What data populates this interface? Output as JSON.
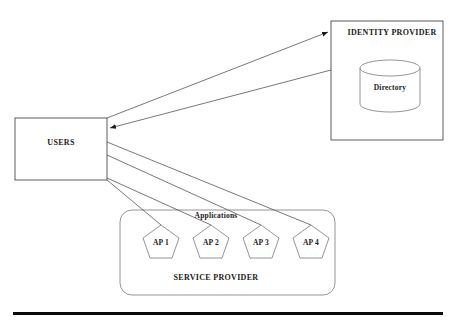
{
  "diagram": {
    "title_semantics": "federated-identity-architecture",
    "colors": {
      "stroke": "#4a4a4a",
      "line": "#555555",
      "text": "#1a1a1a",
      "background": "#ffffff",
      "rule": "#0a0a0a"
    },
    "nodes": {
      "users": {
        "label": "USERS",
        "x": 15,
        "y": 118,
        "width": 92,
        "height": 62
      },
      "identity_provider": {
        "label": "IDENTITY PROVIDER",
        "x": 331,
        "y": 21,
        "width": 112,
        "height": 119
      },
      "directory": {
        "label": "Directory",
        "cx": 390,
        "cy": 86,
        "rx": 30,
        "ry": 8,
        "height": 52
      },
      "service_provider": {
        "label": "SERVICE PROVIDER",
        "x": 120,
        "y": 210,
        "width": 215,
        "height": 85,
        "radius": 12
      },
      "applications_label": {
        "label": "Applications",
        "cx": 216,
        "cy": 215
      }
    },
    "applications": [
      {
        "label": "AP 1",
        "cx": 161,
        "cy": 241
      },
      {
        "label": "AP 2",
        "cx": 211,
        "cy": 241
      },
      {
        "label": "AP 3",
        "cx": 261,
        "cy": 241
      },
      {
        "label": "AP 4",
        "cx": 311,
        "cy": 241
      }
    ],
    "connections": [
      {
        "name": "users-to-identity-provider",
        "from": "users",
        "to": "identity_provider",
        "arrow": "to"
      },
      {
        "name": "identity-provider-to-users",
        "from": "identity_provider",
        "to": "users",
        "arrow": "to"
      },
      {
        "name": "users-to-ap-1",
        "from": "users",
        "to": "ap-1",
        "arrow": "none"
      },
      {
        "name": "users-to-ap-2",
        "from": "users",
        "to": "ap-2",
        "arrow": "none"
      },
      {
        "name": "users-to-ap-3",
        "from": "users",
        "to": "ap-3",
        "arrow": "none"
      },
      {
        "name": "users-to-ap-4",
        "from": "users",
        "to": "ap-4",
        "arrow": "none"
      }
    ],
    "footer_rule": {
      "x": 13,
      "y": 312,
      "width": 430,
      "height": 3
    }
  }
}
